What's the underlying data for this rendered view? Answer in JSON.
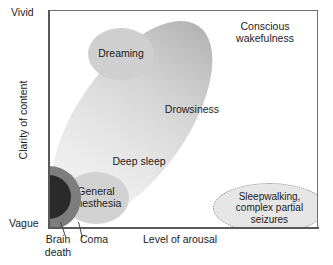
{
  "chart_data": {
    "type": "scatter",
    "title": "",
    "xlabel": "Level of arousal",
    "ylabel": "Clarity of content",
    "x_ticks": [],
    "y_ticks": [
      "Vague",
      "Vivid"
    ],
    "grid": false,
    "legend": "none",
    "axes": {
      "y_low_label": "Vague",
      "y_high_label": "Vivid",
      "x_title": "Level of arousal",
      "y_title": "Clarity of content"
    },
    "regions": [
      {
        "name": "dreaming",
        "label": "Dreaming",
        "shape": "ellipse",
        "fill": "#cfcfcf",
        "border": "none",
        "x_norm": 0.27,
        "y_norm": 0.8
      },
      {
        "name": "drowsiness-band",
        "label": "Drowsiness",
        "shape": "ellipse-rotated",
        "fill": "gradient-gray",
        "border": "none",
        "rotation_deg": 35,
        "x_norm": 0.3,
        "y_norm": 0.5
      },
      {
        "name": "conscious-wakefulness",
        "label": "Conscious wakefulness",
        "label_line1": "Conscious",
        "label_line2": "wakefulness",
        "shape": "band-end",
        "x_norm": 0.8,
        "y_norm": 0.92
      },
      {
        "name": "deep-sleep",
        "label": "Deep sleep",
        "shape": "band-segment",
        "x_norm": 0.27,
        "y_norm": 0.32
      },
      {
        "name": "general-anesthesia",
        "label": "General anesthesia",
        "label_line1": "General",
        "label_line2": "anesthesia",
        "shape": "ellipse",
        "fill": "#d2d2d2",
        "border": "none",
        "x_norm": 0.17,
        "y_norm": 0.14
      },
      {
        "name": "sleepwalking",
        "label": "Sleepwalking, complex partial seizures",
        "label_line1": "Sleepwalking,",
        "label_line2": "complex partial",
        "label_line3": "seizures",
        "shape": "ellipse",
        "fill": "#e6e6e6",
        "border": "dotted",
        "x_norm": 0.82,
        "y_norm": 0.1
      },
      {
        "name": "coma",
        "label": "Coma",
        "shape": "semicircle",
        "fill": "#7d7d7d",
        "x_norm": 0.0,
        "y_norm": 0.0
      },
      {
        "name": "brain-death",
        "label": "Brain death",
        "label_line1": "Brain",
        "label_line2": "death",
        "shape": "semicircle",
        "fill": "#2a2a2a",
        "x_norm": 0.0,
        "y_norm": 0.0
      }
    ],
    "colors": {
      "frame": "#6f6f6f",
      "axis": "#595959",
      "text": "#1b1b1b",
      "background": "#ffffff"
    }
  }
}
